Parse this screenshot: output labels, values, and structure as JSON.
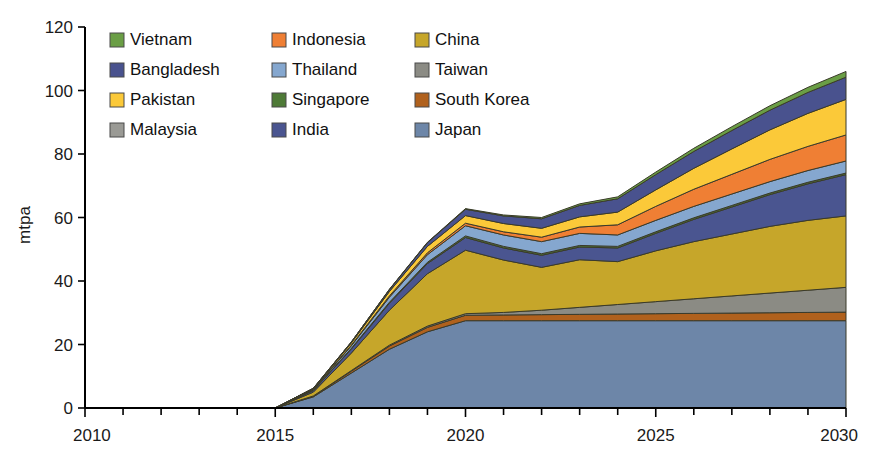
{
  "chart_data": {
    "type": "area",
    "stacked": true,
    "title": "",
    "xlabel": "",
    "ylabel": "mtpa",
    "xlim": [
      2010,
      2030
    ],
    "ylim": [
      0,
      120
    ],
    "ytick_step": 20,
    "yticks": [
      0,
      20,
      40,
      60,
      80,
      100,
      120
    ],
    "xticks": [
      2010,
      2015,
      2020,
      2025,
      2030
    ],
    "xtick_labels": [
      "2010",
      "2015",
      "2020",
      "2025",
      "2030"
    ],
    "x_minor_tick_step": 1,
    "grid": false,
    "legend_position": "top-left-inside",
    "legend_columns": 3,
    "x": [
      2010,
      2011,
      2012,
      2013,
      2014,
      2015,
      2016,
      2017,
      2018,
      2019,
      2020,
      2021,
      2022,
      2023,
      2024,
      2025,
      2026,
      2027,
      2028,
      2029,
      2030
    ],
    "stack_order_bottom_to_top": [
      "Japan",
      "South Korea",
      "Taiwan",
      "China",
      "India",
      "Singapore",
      "Thailand",
      "Indonesia",
      "Pakistan",
      "Bangladesh",
      "Vietnam"
    ],
    "series": [
      {
        "name": "Japan",
        "color": "#6d86a8",
        "values": [
          0,
          0,
          0,
          0,
          0,
          0,
          3.5,
          11.0,
          18.5,
          24.0,
          27.5,
          27.5,
          27.5,
          27.5,
          27.5,
          27.5,
          27.5,
          27.5,
          27.5,
          27.5,
          27.5
        ]
      },
      {
        "name": "South Korea",
        "color": "#b0611d",
        "values": [
          0,
          0,
          0,
          0,
          0,
          0,
          0.2,
          0.6,
          1.0,
          1.4,
          1.7,
          1.8,
          1.9,
          2.0,
          2.1,
          2.2,
          2.3,
          2.4,
          2.5,
          2.6,
          2.7
        ]
      },
      {
        "name": "Taiwan",
        "color": "#8b8b84",
        "values": [
          0,
          0,
          0,
          0,
          0,
          0,
          0.1,
          0.2,
          0.3,
          0.4,
          0.5,
          0.8,
          1.4,
          2.2,
          3.0,
          3.8,
          4.6,
          5.4,
          6.2,
          7.0,
          7.8
        ]
      },
      {
        "name": "China",
        "color": "#c6a62a",
        "values": [
          0,
          0,
          0,
          0,
          0,
          0,
          1.2,
          5.5,
          11.0,
          16.5,
          20.0,
          16.5,
          13.5,
          15.0,
          13.5,
          16.0,
          18.0,
          19.5,
          21.0,
          22.0,
          22.5
        ]
      },
      {
        "name": "India",
        "color": "#4a5590",
        "values": [
          0,
          0,
          0,
          0,
          0,
          0,
          0.5,
          1.3,
          2.2,
          3.2,
          4.0,
          3.8,
          3.8,
          4.0,
          4.3,
          5.5,
          7.0,
          8.5,
          10.0,
          11.5,
          13.0
        ]
      },
      {
        "name": "Singapore",
        "color": "#4e7a37",
        "values": [
          0,
          0,
          0,
          0,
          0,
          0,
          0.1,
          0.2,
          0.3,
          0.4,
          0.5,
          0.5,
          0.5,
          0.5,
          0.5,
          0.5,
          0.5,
          0.5,
          0.5,
          0.5,
          0.5
        ]
      },
      {
        "name": "Thailand",
        "color": "#85a7cf",
        "values": [
          0,
          0,
          0,
          0,
          0,
          0,
          0.2,
          0.8,
          1.6,
          2.4,
          3.2,
          3.6,
          3.8,
          3.8,
          3.6,
          3.6,
          3.6,
          3.6,
          3.6,
          3.7,
          3.8
        ]
      },
      {
        "name": "Indonesia",
        "color": "#ef7f34",
        "values": [
          0,
          0,
          0,
          0,
          0,
          0,
          0.1,
          0.2,
          0.4,
          0.6,
          0.8,
          1.0,
          1.4,
          2.0,
          3.2,
          4.4,
          5.4,
          6.2,
          7.0,
          7.6,
          8.2
        ]
      },
      {
        "name": "Pakistan",
        "color": "#fbc939",
        "values": [
          0,
          0,
          0,
          0,
          0,
          0,
          0.2,
          0.7,
          1.4,
          2.0,
          2.4,
          2.6,
          2.8,
          3.2,
          4.0,
          5.2,
          6.6,
          8.0,
          9.3,
          10.4,
          11.2
        ]
      },
      {
        "name": "Bangladesh",
        "color": "#49528e",
        "values": [
          0,
          0,
          0,
          0,
          0,
          0,
          0.1,
          0.3,
          0.6,
          1.2,
          2.0,
          2.4,
          3.0,
          3.6,
          4.2,
          4.8,
          5.3,
          5.8,
          6.2,
          6.6,
          7.0
        ]
      },
      {
        "name": "Vietnam",
        "color": "#6a9e45",
        "values": [
          0,
          0,
          0,
          0,
          0,
          0,
          0.0,
          0.0,
          0.1,
          0.1,
          0.2,
          0.3,
          0.4,
          0.5,
          0.6,
          0.8,
          1.0,
          1.2,
          1.4,
          1.6,
          1.8
        ]
      }
    ],
    "totals": [
      0,
      0,
      0,
      0,
      0,
      0,
      6.2,
      20.8,
      37.4,
      52.2,
      62.8,
      60.8,
      60.0,
      64.3,
      66.5,
      74.3,
      81.8,
      88.6,
      95.2,
      101.0,
      106.0
    ]
  },
  "axes": {
    "y_title": "mtpa",
    "y_tick_labels": [
      "0",
      "20",
      "40",
      "60",
      "80",
      "100",
      "120"
    ],
    "x_tick_labels": [
      "2010",
      "2015",
      "2020",
      "2025",
      "2030"
    ]
  },
  "legend": {
    "rows": [
      [
        {
          "label": "Vietnam",
          "color": "#6a9e45",
          "icon": "legend-swatch"
        },
        {
          "label": "Indonesia",
          "color": "#ef7f34",
          "icon": "legend-swatch"
        },
        {
          "label": "China",
          "color": "#c6a62a",
          "icon": "legend-swatch"
        }
      ],
      [
        {
          "label": "Bangladesh",
          "color": "#49528e",
          "icon": "legend-swatch"
        },
        {
          "label": "Thailand",
          "color": "#85a7cf",
          "icon": "legend-swatch"
        },
        {
          "label": "Taiwan",
          "color": "#8b8b84",
          "icon": "legend-swatch"
        }
      ],
      [
        {
          "label": "Pakistan",
          "color": "#fbc939",
          "icon": "legend-swatch"
        },
        {
          "label": "Singapore",
          "color": "#4e7a37",
          "icon": "legend-swatch"
        },
        {
          "label": "South Korea",
          "color": "#b0611d",
          "icon": "legend-swatch"
        }
      ],
      [
        {
          "label": "Malaysia",
          "color": "#9a9a95",
          "icon": "legend-swatch"
        },
        {
          "label": "India",
          "color": "#4a5590",
          "icon": "legend-swatch"
        },
        {
          "label": "Japan",
          "color": "#6d86a8",
          "icon": "legend-swatch"
        }
      ]
    ]
  }
}
